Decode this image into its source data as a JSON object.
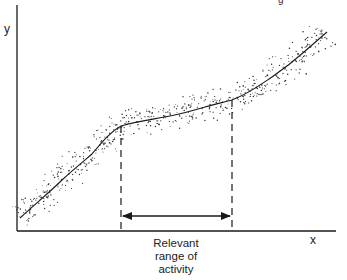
{
  "diagram": {
    "y_axis_label": "y",
    "x_axis_label": "x",
    "range_label_lines": [
      "Relevant",
      "range of",
      "activity"
    ],
    "top_mark": "g",
    "colors": {
      "ink": "#1a1a1a",
      "background": "#ffffff",
      "scatter": "#333333"
    }
  },
  "chart_data": {
    "type": "scatter",
    "title": "",
    "xlabel": "x",
    "ylabel": "y",
    "fitted_curve": {
      "x": [
        0.0,
        0.13,
        0.23,
        0.33,
        0.48,
        0.58,
        0.68,
        0.8,
        0.89,
        0.97
      ],
      "y": [
        0.06,
        0.23,
        0.34,
        0.47,
        0.51,
        0.55,
        0.58,
        0.68,
        0.78,
        0.88
      ]
    },
    "relevant_range": {
      "x_start": 0.33,
      "x_end": 0.68
    },
    "ticks": "none",
    "grid": false,
    "legend": "none"
  }
}
